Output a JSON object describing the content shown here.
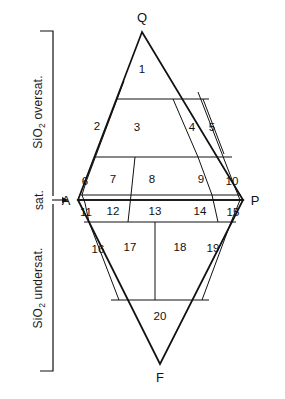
{
  "figure": {
    "type": "qapf-double-triangle-classification-diagram",
    "vertices": [
      {
        "name": "Q",
        "label": "Q",
        "x": 142,
        "y": 30
      },
      {
        "name": "A",
        "label": "A",
        "x": 78,
        "y": 200
      },
      {
        "name": "P",
        "label": "P",
        "x": 243,
        "y": 200
      },
      {
        "name": "F",
        "label": "F",
        "x": 160,
        "y": 366
      }
    ],
    "axis": {
      "oversat_label_main": "SiO",
      "oversat_label_sub": "2",
      "oversat_label_tail": " oversat.",
      "oversat_full": "SiO2 oversat.",
      "sat_label": "sat.",
      "undersat_label_main": "SiO",
      "undersat_label_sub": "2",
      "undersat_label_tail": " undersat.",
      "undersat_full": "SiO2 undersat."
    },
    "fields": [
      {
        "id": 1,
        "label": "1",
        "x": 142,
        "y": 73
      },
      {
        "id": 2,
        "label": "2",
        "x": 97,
        "y": 130
      },
      {
        "id": 3,
        "label": "3",
        "x": 137,
        "y": 131
      },
      {
        "id": 4,
        "label": "4",
        "x": 192,
        "y": 131
      },
      {
        "id": 5,
        "label": "5",
        "x": 212,
        "y": 131
      },
      {
        "id": 6,
        "label": "6",
        "x": 85,
        "y": 181
      },
      {
        "id": 7,
        "label": "7",
        "x": 113,
        "y": 180
      },
      {
        "id": 8,
        "label": "8",
        "x": 152,
        "y": 180
      },
      {
        "id": 9,
        "label": "9",
        "x": 201,
        "y": 180
      },
      {
        "id": 10,
        "label": "10",
        "x": 231,
        "y": 181
      },
      {
        "id": 11,
        "label": "11",
        "x": 85,
        "y": 213
      },
      {
        "id": 12,
        "label": "12",
        "x": 113,
        "y": 212
      },
      {
        "id": 13,
        "label": "13",
        "x": 155,
        "y": 212
      },
      {
        "id": 14,
        "label": "14",
        "x": 200,
        "y": 212
      },
      {
        "id": 15,
        "label": "15",
        "x": 232,
        "y": 212
      },
      {
        "id": 16,
        "label": "16",
        "x": 98,
        "y": 250
      },
      {
        "id": 17,
        "label": "17",
        "x": 130,
        "y": 248
      },
      {
        "id": 18,
        "label": "18",
        "x": 180,
        "y": 248
      },
      {
        "id": 19,
        "label": "19",
        "x": 213,
        "y": 249
      },
      {
        "id": 20,
        "label": "20",
        "x": 160,
        "y": 317
      }
    ],
    "colors": {
      "line": "#111111",
      "background": "#ffffff",
      "text": "#111111"
    }
  }
}
